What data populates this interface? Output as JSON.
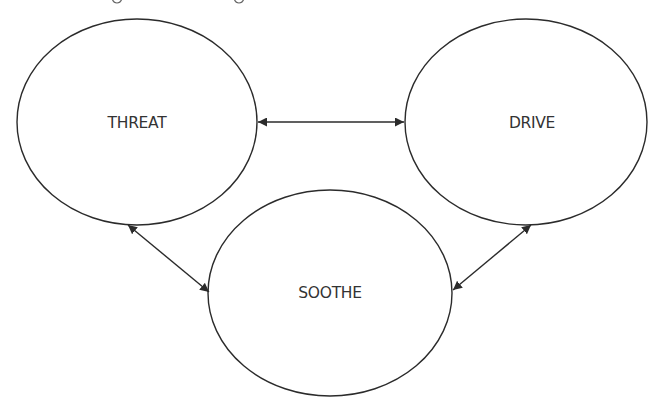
{
  "diagram": {
    "type": "three-circles-model",
    "nodes": [
      {
        "id": "threat",
        "label": "THREAT"
      },
      {
        "id": "drive",
        "label": "DRIVE"
      },
      {
        "id": "soothe",
        "label": "SOOTHE"
      }
    ],
    "edges": [
      {
        "from": "threat",
        "to": "drive",
        "direction": "both"
      },
      {
        "from": "threat",
        "to": "soothe",
        "direction": "both"
      },
      {
        "from": "drive",
        "to": "soothe",
        "direction": "both"
      }
    ],
    "colors": {
      "stroke": "#2b2b2b",
      "text": "#333333",
      "background": "#ffffff"
    }
  }
}
